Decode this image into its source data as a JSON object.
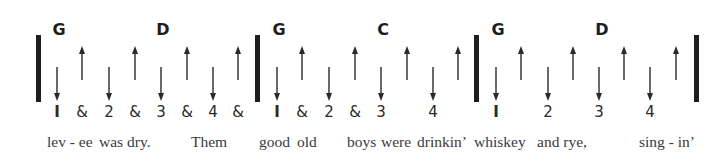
{
  "measures": [
    {
      "chords": [
        {
          "name": "G",
          "x": 59
        },
        {
          "name": "D",
          "x": 163
        }
      ],
      "counts": [
        {
          "label": "I",
          "x": 57
        },
        {
          "label": "&",
          "x": 82
        },
        {
          "label": "2",
          "x": 109
        },
        {
          "label": "&",
          "x": 135
        },
        {
          "label": "3",
          "x": 161
        },
        {
          "label": "&",
          "x": 187
        },
        {
          "label": "4",
          "x": 213
        },
        {
          "label": "&",
          "x": 238
        }
      ],
      "strums": [
        {
          "dir": "down",
          "x": 57
        },
        {
          "dir": "up",
          "x": 82
        },
        {
          "dir": "down",
          "x": 109
        },
        {
          "dir": "up",
          "x": 135
        },
        {
          "dir": "down",
          "x": 161
        },
        {
          "dir": "up",
          "x": 187
        },
        {
          "dir": "down",
          "x": 213
        },
        {
          "dir": "up",
          "x": 238
        }
      ]
    },
    {
      "chords": [
        {
          "name": "G",
          "x": 279
        },
        {
          "name": "C",
          "x": 383
        }
      ],
      "counts": [
        {
          "label": "I",
          "x": 277
        },
        {
          "label": "&",
          "x": 302
        },
        {
          "label": "2",
          "x": 329
        },
        {
          "label": "&",
          "x": 355
        },
        {
          "label": "3",
          "x": 381
        },
        {
          "label": "4",
          "x": 433
        }
      ],
      "strums": [
        {
          "dir": "down",
          "x": 277
        },
        {
          "dir": "up",
          "x": 302
        },
        {
          "dir": "down",
          "x": 329
        },
        {
          "dir": "up",
          "x": 355
        },
        {
          "dir": "down",
          "x": 381
        },
        {
          "dir": "up",
          "x": 407
        },
        {
          "dir": "down",
          "x": 433
        },
        {
          "dir": "up",
          "x": 458
        }
      ]
    },
    {
      "chords": [
        {
          "name": "G",
          "x": 498
        },
        {
          "name": "D",
          "x": 602
        }
      ],
      "counts": [
        {
          "label": "I",
          "x": 496
        },
        {
          "label": "2",
          "x": 548
        },
        {
          "label": "3",
          "x": 599
        },
        {
          "label": "4",
          "x": 650
        }
      ],
      "strums": [
        {
          "dir": "down",
          "x": 496
        },
        {
          "dir": "up",
          "x": 521
        },
        {
          "dir": "down",
          "x": 548
        },
        {
          "dir": "up",
          "x": 573
        },
        {
          "dir": "down",
          "x": 599
        },
        {
          "dir": "up",
          "x": 624
        },
        {
          "dir": "down",
          "x": 650
        },
        {
          "dir": "up",
          "x": 676
        }
      ]
    }
  ],
  "barlines": [
    36,
    255,
    474,
    694
  ],
  "lyrics": [
    {
      "text": "lev - ee",
      "x": 47
    },
    {
      "text": "was dry.",
      "x": 99
    },
    {
      "text": "Them",
      "x": 191
    },
    {
      "text": "good",
      "x": 259
    },
    {
      "text": "old",
      "x": 297
    },
    {
      "text": "boys",
      "x": 347
    },
    {
      "text": "were",
      "x": 381
    },
    {
      "text": "drinkin’",
      "x": 417
    },
    {
      "text": "whiskey",
      "x": 474
    },
    {
      "text": "and rye,",
      "x": 537
    },
    {
      "text": "sing - in’",
      "x": 639
    }
  ]
}
